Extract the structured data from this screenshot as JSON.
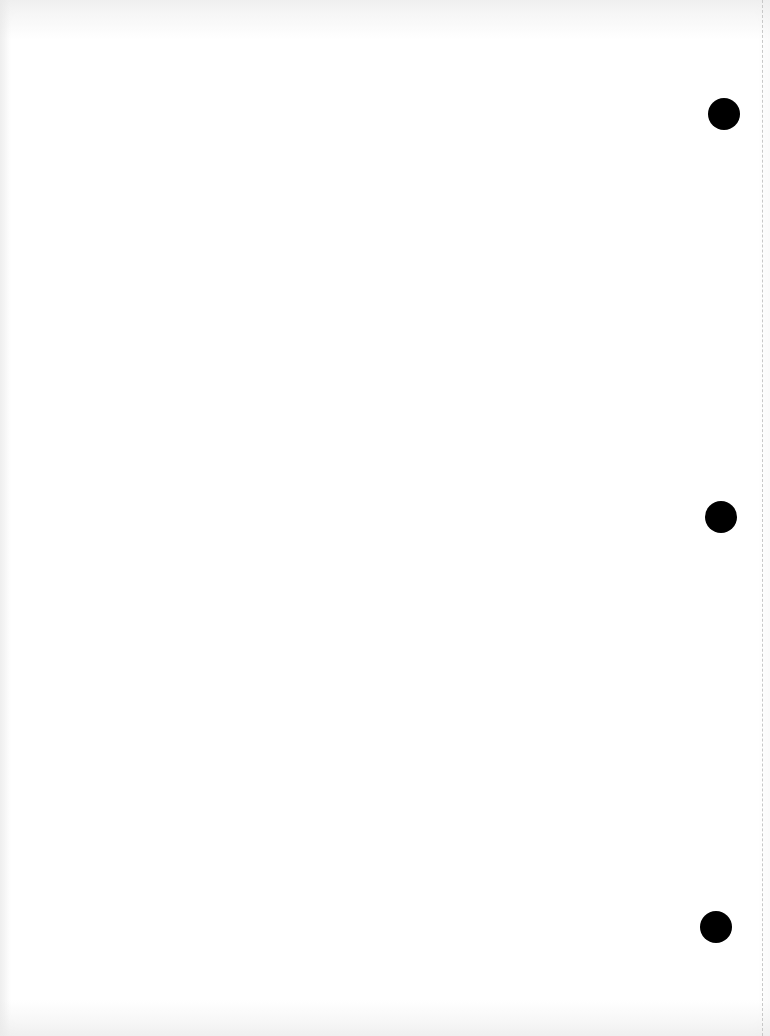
{
  "document": {
    "type": "blank-scanned-page",
    "background_color": "#ffffff",
    "bleed_through_text": ""
  },
  "punch_holes": [
    {
      "label": "top",
      "cx": 724,
      "cy": 114,
      "diameter": 32,
      "color": "#000000"
    },
    {
      "label": "middle",
      "cx": 721,
      "cy": 517,
      "diameter": 32,
      "color": "#000000"
    },
    {
      "label": "bottom",
      "cx": 716,
      "cy": 927,
      "diameter": 32,
      "color": "#000000"
    }
  ],
  "perforation": {
    "x": 762,
    "style": "dashed",
    "color": "#c8c8c8"
  }
}
